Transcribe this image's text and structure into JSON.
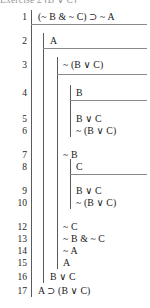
{
  "document": {
    "type": "fitch-style-natural-deduction-proof",
    "clipped_caption": "Exercise 2 (B ∨ C)",
    "conclusion": "A ⊃ (B ∨ C)"
  },
  "proof": {
    "lines": [
      {
        "number": "1",
        "formula": "(~ B & ~ C) ⊃ ~ A",
        "depth": 1,
        "y": 12,
        "rule_below": true
      },
      {
        "number": "2",
        "formula": "A",
        "depth": 2,
        "y": 36,
        "rule_below": true
      },
      {
        "number": "3",
        "formula": "~ (B ∨ C)",
        "depth": 3,
        "y": 60,
        "rule_below": true
      },
      {
        "number": "4",
        "formula": "B",
        "depth": 4,
        "y": 88,
        "rule_below": true
      },
      {
        "number": "5",
        "formula": "B ∨ C",
        "depth": 4,
        "y": 114,
        "rule_below": false
      },
      {
        "number": "6",
        "formula": "~ (B ∨ C)",
        "depth": 4,
        "y": 126,
        "rule_below": false
      },
      {
        "number": "7",
        "formula": "~ B",
        "depth": 3,
        "y": 150,
        "rule_below": false
      },
      {
        "number": "8",
        "formula": "C",
        "depth": 4,
        "y": 162,
        "rule_below": true
      },
      {
        "number": "9",
        "formula": "B ∨ C",
        "depth": 4,
        "y": 186,
        "rule_below": false
      },
      {
        "number": "10",
        "formula": "~ (B ∨ C)",
        "depth": 4,
        "y": 198,
        "rule_below": false
      },
      {
        "number": "12",
        "formula": "~ C",
        "depth": 3,
        "y": 222,
        "rule_below": false
      },
      {
        "number": "13",
        "formula": "~ B & ~ C",
        "depth": 3,
        "y": 234,
        "rule_below": false
      },
      {
        "number": "14",
        "formula": "~ A",
        "depth": 3,
        "y": 246,
        "rule_below": false
      },
      {
        "number": "15",
        "formula": "A",
        "depth": 3,
        "y": 258,
        "rule_below": false
      },
      {
        "number": "16",
        "formula": "B ∨ C",
        "depth": 2,
        "y": 272,
        "rule_below": false
      },
      {
        "number": "17",
        "formula": "A ⊃ (B ∨ C)",
        "depth": 1,
        "y": 286,
        "rule_below": false
      }
    ],
    "scopes": [
      {
        "name": "outer-premise-scope",
        "depth": 1,
        "x": 31,
        "top": 10,
        "bottom": 297
      },
      {
        "name": "assumption-A-scope",
        "depth": 2,
        "x": 43,
        "top": 33,
        "bottom": 283
      },
      {
        "name": "assumption-notBvC-scope",
        "depth": 3,
        "x": 57,
        "top": 57,
        "bottom": 269
      },
      {
        "name": "assumption-B-scope",
        "depth": 4,
        "x": 70,
        "top": 85,
        "bottom": 137
      },
      {
        "name": "assumption-C-scope",
        "depth": 4,
        "x": 70,
        "top": 159,
        "bottom": 209
      }
    ],
    "rules": [
      {
        "name": "rule-under-line-1",
        "x": 31,
        "width": 116,
        "y": 24
      },
      {
        "name": "rule-under-line-2",
        "x": 43,
        "width": 104,
        "y": 48
      },
      {
        "name": "rule-under-line-3",
        "x": 57,
        "width": 90,
        "y": 74
      },
      {
        "name": "rule-under-line-4",
        "x": 70,
        "width": 77,
        "y": 100
      },
      {
        "name": "rule-under-line-8",
        "x": 70,
        "width": 77,
        "y": 174
      }
    ]
  },
  "style": {
    "ink": "#1a1a1a",
    "bar_color": "#5a5a5a",
    "rule_color": "#8a8a8a",
    "background": "#ffffff"
  }
}
